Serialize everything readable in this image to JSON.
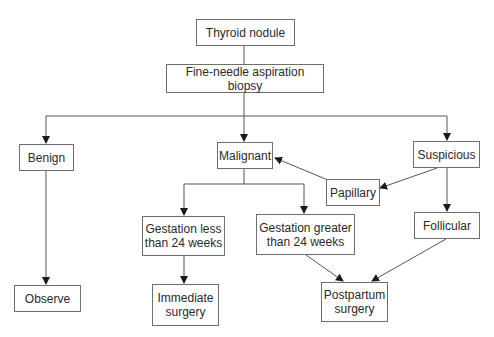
{
  "diagram": {
    "type": "flowchart",
    "colors": {
      "line": "#555555",
      "box_border": "#6e6e6e",
      "text": "#2a2a2a",
      "background": "#ffffff"
    },
    "nodes": {
      "thyroid_nodule": {
        "label": "Thyroid nodule"
      },
      "fna_biopsy": {
        "label": "Fine-needle aspiration biopsy"
      },
      "benign": {
        "label": "Benign"
      },
      "malignant": {
        "label": "Malignant"
      },
      "suspicious": {
        "label": "Suspicious"
      },
      "papillary": {
        "label": "Papillary"
      },
      "follicular": {
        "label": "Follicular"
      },
      "gestation_less": {
        "label": "Gestation less\nthan 24 weeks"
      },
      "gestation_greater": {
        "label": "Gestation greater\nthan 24 weeks"
      },
      "observe": {
        "label": "Observe"
      },
      "immediate_surgery": {
        "label": "Immediate\nsurgery"
      },
      "postpartum_surgery": {
        "label": "Postpartum\nsurgery"
      }
    },
    "edges": [
      {
        "from": "Thyroid nodule",
        "to": "Fine-needle aspiration biopsy"
      },
      {
        "from": "Fine-needle aspiration biopsy",
        "to": "Benign"
      },
      {
        "from": "Fine-needle aspiration biopsy",
        "to": "Malignant"
      },
      {
        "from": "Fine-needle aspiration biopsy",
        "to": "Suspicious"
      },
      {
        "from": "Suspicious",
        "to": "Papillary"
      },
      {
        "from": "Papillary",
        "to": "Malignant"
      },
      {
        "from": "Suspicious",
        "to": "Follicular"
      },
      {
        "from": "Benign",
        "to": "Observe"
      },
      {
        "from": "Malignant",
        "to": "Gestation less than 24 weeks"
      },
      {
        "from": "Malignant",
        "to": "Gestation greater than 24 weeks"
      },
      {
        "from": "Gestation less than 24 weeks",
        "to": "Immediate surgery"
      },
      {
        "from": "Gestation greater than 24 weeks",
        "to": "Postpartum surgery"
      },
      {
        "from": "Follicular",
        "to": "Postpartum surgery"
      }
    ]
  }
}
